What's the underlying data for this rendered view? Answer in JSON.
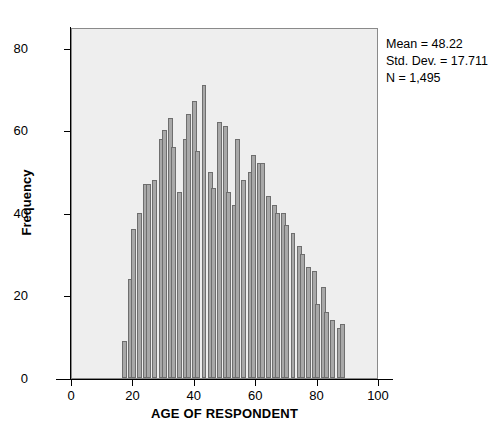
{
  "chart_data": {
    "type": "bar",
    "title": "",
    "xlabel": "AGE OF RESPONDENT",
    "ylabel": "Frequency",
    "xlim": [
      0,
      100
    ],
    "ylim": [
      0,
      85
    ],
    "xticks": [
      0,
      20,
      40,
      60,
      80,
      100
    ],
    "yticks": [
      0,
      20,
      40,
      60,
      80
    ],
    "grid": false,
    "legend": null,
    "bar_color": "#a8a8a8",
    "bar_edge_color": "#6e6e6e",
    "plot_background": "#eeeeee",
    "bin_width": 1.6,
    "bin_start": 16.6,
    "categories": [
      17,
      19,
      20,
      22,
      24,
      25,
      27,
      29,
      30,
      32,
      33,
      35,
      37,
      38,
      40,
      41,
      43,
      45,
      46,
      48,
      50,
      51,
      53,
      54,
      56,
      58,
      59,
      61,
      62,
      64,
      66,
      67,
      69,
      70,
      72,
      74,
      75,
      77,
      79,
      80,
      82,
      83,
      85,
      87,
      88
    ],
    "values": [
      9,
      24,
      36,
      40,
      47,
      47,
      48,
      58,
      60,
      63,
      56,
      45,
      58,
      64,
      67,
      55,
      71,
      50,
      46,
      62,
      61,
      45,
      42,
      58,
      48,
      50,
      54,
      52,
      52,
      44,
      42,
      40,
      40,
      37,
      35,
      32,
      30,
      27,
      26,
      18,
      22,
      16,
      14,
      12,
      13
    ]
  },
  "annotations": {
    "mean_label": "Mean = 48.22",
    "std_dev_label": "Std. Dev. = 17.711",
    "n_label": "N = 1,495"
  }
}
